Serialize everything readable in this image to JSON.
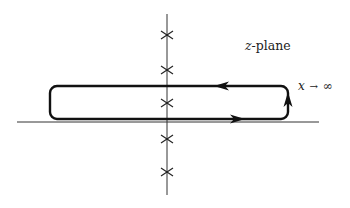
{
  "diagram": {
    "title_label": {
      "var": "z",
      "suffix": "-plane"
    },
    "limit_label": {
      "var": "x",
      "arrow": "→",
      "infinity": "∞"
    },
    "axes": {
      "horizontal": {
        "x1": 17,
        "x2": 319,
        "y": 122
      },
      "vertical": {
        "x": 167,
        "y1": 14,
        "y2": 195
      }
    },
    "poles": [
      {
        "x": 167,
        "y": 35
      },
      {
        "x": 167,
        "y": 70
      },
      {
        "x": 167,
        "y": 103
      },
      {
        "x": 167,
        "y": 139
      },
      {
        "x": 167,
        "y": 172
      }
    ],
    "contour": {
      "left": 50,
      "right": 288,
      "top": 86,
      "bottom": 119,
      "corner_radius": 7,
      "arrows": [
        {
          "direction": "left",
          "x": 222,
          "y": 86
        },
        {
          "direction": "right",
          "x": 237,
          "y": 119
        },
        {
          "direction": "up",
          "x": 288,
          "y": 100
        }
      ]
    },
    "colors": {
      "line": "#111111",
      "axis": "#333333",
      "background": "#ffffff"
    }
  }
}
